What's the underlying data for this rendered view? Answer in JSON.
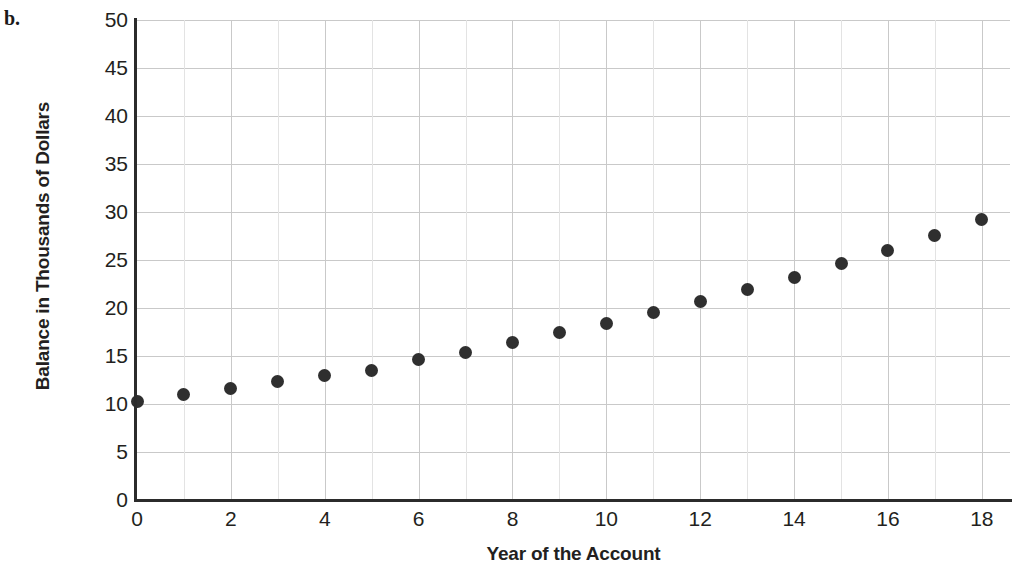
{
  "figure": {
    "part_label": "b."
  },
  "chart_data": {
    "type": "scatter",
    "title": "",
    "xlabel": "Year of the Account",
    "ylabel": "Balance in Thousands of Dollars",
    "xlim": [
      0,
      18.6
    ],
    "ylim": [
      0,
      50
    ],
    "grid": true,
    "legend": null,
    "x_tick_labels": [
      "0",
      "2",
      "4",
      "6",
      "8",
      "10",
      "12",
      "14",
      "16",
      "18"
    ],
    "x_tick_values": [
      0,
      2,
      4,
      6,
      8,
      10,
      12,
      14,
      16,
      18
    ],
    "y_tick_labels": [
      "0",
      "5",
      "10",
      "15",
      "20",
      "25",
      "30",
      "35",
      "40",
      "45",
      "50"
    ],
    "y_tick_values": [
      0,
      5,
      10,
      15,
      20,
      25,
      30,
      35,
      40,
      45,
      50
    ],
    "x_minor_step": 1,
    "y_minor_step": 5,
    "marker": "filled-circle",
    "marker_color": "#2f2f2f",
    "grid_color": "#c9c9c9",
    "axis_color": "#2b2b2b",
    "x": [
      0,
      1,
      2,
      3,
      4,
      5,
      6,
      7,
      8,
      9,
      10,
      11,
      12,
      13,
      14,
      15,
      16,
      17,
      18
    ],
    "values": [
      10.3,
      11.0,
      11.6,
      12.3,
      13.0,
      13.5,
      14.6,
      15.4,
      16.4,
      17.4,
      18.4,
      19.5,
      20.7,
      21.9,
      23.2,
      24.6,
      26.0,
      27.6,
      29.2
    ]
  }
}
